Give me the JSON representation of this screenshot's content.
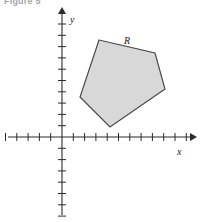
{
  "figure": {
    "caption": "Figure 5",
    "background_color": "#ffffff"
  },
  "axes": {
    "x_label": "x",
    "y_label": "y",
    "origin": {
      "x": 62,
      "y": 137
    },
    "tick_spacing": 11.3,
    "axis_color": "#2b2b2b",
    "x_ticks_negative": 5,
    "x_ticks_positive": 11,
    "y_ticks_positive": 10,
    "y_ticks_negative": 7,
    "x_axis_start": 8,
    "x_axis_end": 190,
    "y_axis_top": 14,
    "y_axis_bottom": 215,
    "tick_half_length": 4
  },
  "chart_data": {
    "type": "scatter",
    "title": "Figure 5",
    "xlabel": "x",
    "ylabel": "y",
    "grid": false,
    "legend": false,
    "xlim": [
      -5,
      11
    ],
    "ylim": [
      -7,
      10
    ],
    "annotations": [
      {
        "text": "R",
        "x": 5.75,
        "y": 8.6
      }
    ],
    "shapes": [
      {
        "name": "region-R",
        "type": "polygon",
        "label": "R",
        "fill": "#d8d8d8",
        "stroke": "#4a4a4a",
        "stroke_width": 1.2,
        "vertices_px": [
          [
            99,
            40
          ],
          [
            155,
            53
          ],
          [
            165,
            89
          ],
          [
            110,
            127
          ],
          [
            80,
            97
          ]
        ],
        "vertices_data": [
          [
            3.3,
            8.6
          ],
          [
            8.2,
            7.4
          ],
          [
            9.1,
            4.2
          ],
          [
            4.2,
            0.9
          ],
          [
            1.6,
            3.5
          ]
        ]
      }
    ]
  }
}
